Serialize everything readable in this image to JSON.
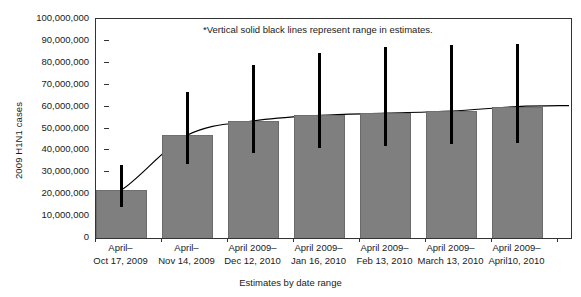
{
  "chart_data": {
    "type": "bar",
    "title": "",
    "xlabel": "Estimates by date range",
    "ylabel": "2009 H1N1 cases",
    "ylim": [
      0,
      100000000
    ],
    "grid": false,
    "legend": "none",
    "annotation": "*Vertical solid black lines represent range in estimates.",
    "ytick_labels": [
      "100,000,000",
      "90,000,000",
      "80,000,000",
      "70,000,000",
      "60,000,000",
      "50,000,000",
      "40,000,000",
      "30,000,000",
      "20,000,000",
      "10,000,000",
      "0"
    ],
    "ytick_values": [
      100000000,
      90000000,
      80000000,
      70000000,
      60000000,
      50000000,
      40000000,
      30000000,
      20000000,
      10000000,
      0
    ],
    "categories": [
      {
        "line1": "April–",
        "line2": "Oct 17, 2009"
      },
      {
        "line1": "April–",
        "line2": "Nov 14, 2009"
      },
      {
        "line1": "April 2009–",
        "line2": "Dec 12, 2010"
      },
      {
        "line1": "April 2009–",
        "line2": "Jan 16, 2010"
      },
      {
        "line1": "April 2009–",
        "line2": "Feb 13, 2010"
      },
      {
        "line1": "April 2009–",
        "line2": "March 13, 2010"
      },
      {
        "line1": "April 2009–",
        "line2": "April10, 2010"
      }
    ],
    "values": [
      22000000,
      47000000,
      53500000,
      56000000,
      57000000,
      58000000,
      60000000
    ],
    "error_low": [
      14000000,
      34000000,
      39000000,
      41000000,
      42000000,
      43000000,
      43500000
    ],
    "error_high": [
      33500000,
      66500000,
      79000000,
      84500000,
      87000000,
      88000000,
      88500000
    ],
    "trend_line": {
      "present": true,
      "description": "smooth black curve connecting bar tops",
      "values": [
        22000000,
        47000000,
        53500000,
        56000000,
        57000000,
        58000000,
        60000000
      ]
    },
    "colors": {
      "bar_fill": "#7f7f7f",
      "error_bar": "#000000",
      "axis": "#333333",
      "trend_line": "#000000",
      "background": "#ffffff"
    }
  }
}
